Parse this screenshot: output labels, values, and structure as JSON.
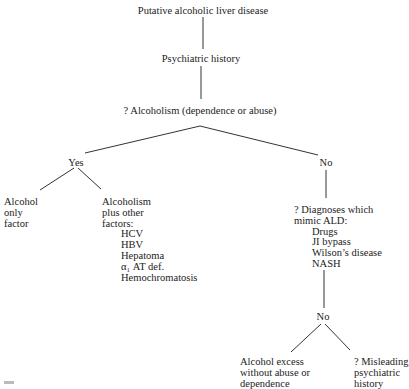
{
  "diagram": {
    "root": "Putative alcoholic liver disease",
    "level2": "Psychiatric history",
    "level3": "? Alcoholism (dependence or abuse)",
    "branch_yes": {
      "label": "Yes",
      "left": [
        "Alcohol",
        "only",
        "factor"
      ],
      "right": {
        "heading": [
          "Alcoholism",
          "plus other",
          "factors:"
        ],
        "items": [
          "HCV",
          "HBV",
          "Hepatoma",
          "α₁ AT def.",
          "Hemochromatosis"
        ]
      }
    },
    "branch_no": {
      "label": "No",
      "node": {
        "heading": [
          "? Diagnoses which",
          "mimic ALD:"
        ],
        "items": [
          "Drugs",
          "JI bypass",
          "Wilson’s disease",
          "NASH"
        ]
      },
      "sub_label": "No",
      "left": [
        "Alcohol excess",
        "without abuse or",
        "dependence"
      ],
      "right": [
        "? Misleading",
        "psychiatric",
        "history"
      ]
    }
  },
  "colors": {
    "line": "#333333",
    "text": "#222222",
    "background": "#ffffff"
  }
}
